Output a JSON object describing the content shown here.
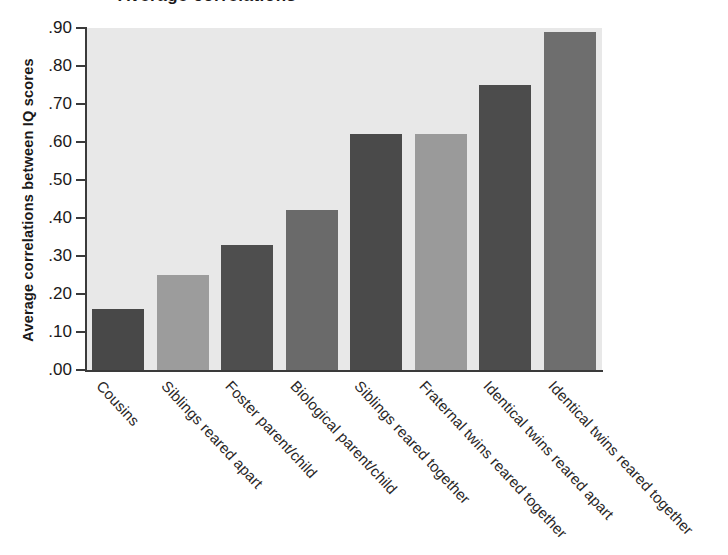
{
  "figure": {
    "cropped_title_fragment": "Average correlations",
    "y_axis_title": "Average correlations between IQ scores"
  },
  "chart_data": {
    "type": "bar",
    "title": "",
    "xlabel": "",
    "ylabel": "Average correlations between IQ scores",
    "ylim": [
      0.0,
      0.9
    ],
    "ytick_labels": [
      ".90",
      ".80",
      ".70",
      ".60",
      ".50",
      ".40",
      ".30",
      ".20",
      ".10",
      ".00"
    ],
    "ytick_values": [
      0.9,
      0.8,
      0.7,
      0.6,
      0.5,
      0.4,
      0.3,
      0.2,
      0.1,
      0.0
    ],
    "grid": false,
    "legend": "none",
    "plot_background_color": "#e8e8e8",
    "categories": [
      "Cousins",
      "Siblings reared apart",
      "Foster parent/child",
      "Biological parent/child",
      "Siblings reared together",
      "Fraternal twins reared together",
      "Identical twins reared apart",
      "Identical twins reared together"
    ],
    "values": [
      0.16,
      0.25,
      0.33,
      0.42,
      0.62,
      0.62,
      0.75,
      0.89
    ],
    "bar_colors": [
      "#484848",
      "#9c9c9c",
      "#4e4e4e",
      "#6a6a6a",
      "#4a4a4a",
      "#9a9a9a",
      "#4c4c4c",
      "#6e6e6e"
    ]
  }
}
